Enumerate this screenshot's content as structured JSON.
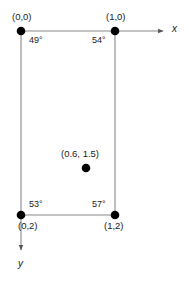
{
  "figure": {
    "background_color": "#ffffff",
    "line_color": "#808080",
    "node_color": "#000000",
    "text_color": "#1a1a1a",
    "nodes": [
      {
        "id": "n00",
        "label": "(0,0)",
        "x": 21,
        "y": 31,
        "label_x": 12,
        "label_y": 12
      },
      {
        "id": "n10",
        "label": "(1,0)",
        "x": 115,
        "y": 31,
        "label_x": 106,
        "label_y": 12
      },
      {
        "id": "n02",
        "label": "(0,2)",
        "x": 21,
        "y": 215,
        "label_x": 18,
        "label_y": 221
      },
      {
        "id": "n12",
        "label": "(1,2)",
        "x": 115,
        "y": 215,
        "label_x": 104,
        "label_y": 221
      }
    ],
    "interior_point": {
      "label": "(0.6, 1.5)",
      "x": 86,
      "y": 168,
      "label_x": 61,
      "label_y": 149
    },
    "angles": [
      {
        "id": "a00",
        "value": "49°",
        "x": 29,
        "y": 35
      },
      {
        "id": "a10",
        "value": "54°",
        "x": 92,
        "y": 35
      },
      {
        "id": "a02",
        "value": "53°",
        "x": 29,
        "y": 199
      },
      {
        "id": "a12",
        "value": "57°",
        "x": 92,
        "y": 199
      }
    ],
    "axes": [
      {
        "id": "x-axis",
        "label": "x",
        "label_x": 172,
        "label_y": 24
      },
      {
        "id": "y-axis",
        "label": "y",
        "label_x": 18,
        "label_y": 259
      }
    ],
    "caption": ""
  }
}
